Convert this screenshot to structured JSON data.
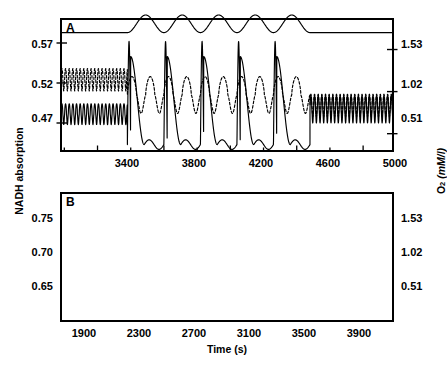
{
  "figure": {
    "axis_titles": {
      "left": "NADH absorption",
      "right_main": "O",
      "right_sub": "2",
      "right_unit": "(mM/l)",
      "x": "Time (s)"
    },
    "colors": {
      "ink": "#000000",
      "background": "#ffffff"
    }
  },
  "panels": [
    {
      "letter": "A",
      "y_left_ticks": [
        "0.57",
        "0.52",
        "0.47"
      ],
      "y_right_ticks": [
        "1.53",
        "1.02",
        "0.51"
      ],
      "x_ticks": [
        "3400",
        "3800",
        "4200",
        "4600",
        "5000"
      ]
    },
    {
      "letter": "B",
      "y_left_ticks": [
        "0.75",
        "0.70",
        "0.65"
      ],
      "y_right_ticks": [
        "1.53",
        "1.02",
        "0.51"
      ],
      "x_ticks": [
        "1900",
        "2300",
        "2700",
        "3100",
        "3500",
        "3900"
      ]
    }
  ],
  "chart_data": {
    "type": "line",
    "title": "",
    "xlabel": "Time (s)",
    "ylabel": "NADH absorption",
    "y2label": "O2 (mM/l)",
    "grid": false,
    "legend": "none",
    "subplots": [
      {
        "label": "A",
        "xlim": [
          3180,
          5180
        ],
        "xticks": [
          3400,
          3800,
          4200,
          4600,
          5000
        ],
        "xminor_step": 200,
        "ylim_left": [
          0.435,
          0.6
        ],
        "yticks_left": [
          0.57,
          0.52,
          0.47
        ],
        "ylim_right": [
          0.3,
          1.9
        ],
        "yticks_right": [
          1.53,
          1.02,
          0.51
        ],
        "forcing": {
          "description": "sinusoidal glucose-input perturbation trace drawn at top of panel",
          "baseline_value": 0.583,
          "amplitude": 0.011,
          "start_time": 3580,
          "end_time": 4680,
          "n_cycles": 5,
          "period": 220
        },
        "series": [
          {
            "name": "NADH absorption",
            "style": "solid",
            "description": "fast small-amplitude oscillation before and after forcing; large-amplitude entrained bursts during forcing",
            "segments": [
              {
                "phase": "before",
                "t_start": 3180,
                "t_end": 3580,
                "period": 22,
                "mean": 0.481,
                "amplitude": 0.013
              },
              {
                "phase": "forced",
                "t_start": 3580,
                "t_end": 4680,
                "period": 220,
                "mean": 0.498,
                "amplitude": 0.055,
                "spike_peak": 0.572,
                "trough": 0.443
              },
              {
                "phase": "after",
                "t_start": 4680,
                "t_end": 5180,
                "period": 22,
                "mean": 0.487,
                "amplitude": 0.017
              }
            ]
          },
          {
            "name": "O2 concentration",
            "style": "dashed",
            "description": "dashed trace oscillating above the solid NADH trace",
            "segments": [
              {
                "phase": "before",
                "t_start": 3180,
                "t_end": 3580,
                "period": 22,
                "mean": 0.524,
                "amplitude": 0.014
              },
              {
                "phase": "forced",
                "t_start": 3580,
                "t_end": 4680,
                "period": 110,
                "mean": 0.505,
                "amplitude": 0.023
              },
              {
                "phase": "after",
                "t_start": 4680,
                "t_end": 5180,
                "period": 22,
                "mean": 0.492,
                "amplitude": 0.014
              }
            ]
          }
        ]
      },
      {
        "label": "B",
        "xlim": [
          1700,
          4120
        ],
        "xticks": [
          1900,
          2300,
          2700,
          3100,
          3500,
          3900
        ],
        "xminor_step": 200,
        "ylim_left": [
          0.605,
          0.795
        ],
        "yticks_left": [
          0.75,
          0.7,
          0.65
        ],
        "ylim_right": [
          0.3,
          1.9
        ],
        "yticks_right": [
          1.53,
          1.02,
          0.51
        ],
        "forcing": {
          "description": "fast sinusoidal perturbation trace drawn at top of panel",
          "baseline_value": 0.772,
          "amplitude": 0.01,
          "start_time": 2480,
          "end_time": 3390,
          "n_cycles": 15,
          "period": 60
        },
        "series": [
          {
            "name": "NADH absorption",
            "style": "solid",
            "description": "regular oscillation, amplitude increases during forcing then relaxes with longer period afterwards",
            "segments": [
              {
                "phase": "before",
                "t_start": 1700,
                "t_end": 2480,
                "period": 60,
                "mean": 0.655,
                "amplitude": 0.031
              },
              {
                "phase": "forced",
                "t_start": 2480,
                "t_end": 3390,
                "period": 60,
                "mean": 0.67,
                "amplitude": 0.053
              },
              {
                "phase": "after",
                "t_start": 3390,
                "t_end": 4120,
                "period": 82,
                "mean": 0.655,
                "amplitude": 0.042
              }
            ]
          },
          {
            "name": "O2 concentration",
            "style": "dashed",
            "description": "dashed trace tracking the solid trace with smaller amplitude, strongly damped after forcing ends",
            "segments": [
              {
                "phase": "before",
                "t_start": 1700,
                "t_end": 2480,
                "period": 60,
                "mean": 0.672,
                "amplitude": 0.022
              },
              {
                "phase": "forced",
                "t_start": 2480,
                "t_end": 3390,
                "period": 60,
                "mean": 0.685,
                "amplitude": 0.035
              },
              {
                "phase": "after",
                "t_start": 3390,
                "t_end": 4120,
                "period": 82,
                "mean": 0.652,
                "amplitude": 0.02
              }
            ]
          }
        ]
      }
    ]
  }
}
